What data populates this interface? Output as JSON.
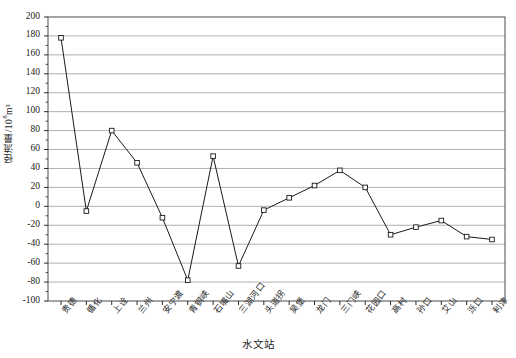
{
  "chart_data": {
    "type": "line",
    "title": "",
    "xlabel": "水文站",
    "ylabel": "径流量/10⁸m³",
    "ylabel_base": "径流量/10",
    "ylabel_exp": "8",
    "ylabel_unit": "m³",
    "ylim": [
      -100,
      200
    ],
    "ytick_step": 20,
    "grid": true,
    "legend": "none",
    "marker": "open-square",
    "line_color": "#1a1a1a",
    "grid_color": "#9a9a9a",
    "categories": [
      "贵德",
      "循化",
      "上诠",
      "兰州",
      "安宁渡",
      "青铜峡",
      "石嘴山",
      "三湖河口",
      "头道拐",
      "吴堡",
      "龙门",
      "三门峡",
      "花园口",
      "高村",
      "孙口",
      "艾山",
      "泺口",
      "利津"
    ],
    "values": [
      178,
      -5,
      80,
      46,
      -12,
      -78,
      53,
      -63,
      -4,
      9,
      22,
      38,
      20,
      -30,
      -22,
      -15,
      -32,
      -35
    ],
    "ytick_labels": [
      "200",
      "180",
      "160",
      "140",
      "120",
      "100",
      "80",
      "60",
      "40",
      "20",
      "0",
      "-20",
      "-40",
      "-60",
      "-80",
      "-100"
    ],
    "ytick_values": [
      200,
      180,
      160,
      140,
      120,
      100,
      80,
      60,
      40,
      20,
      0,
      -20,
      -40,
      -60,
      -80,
      -100
    ]
  }
}
